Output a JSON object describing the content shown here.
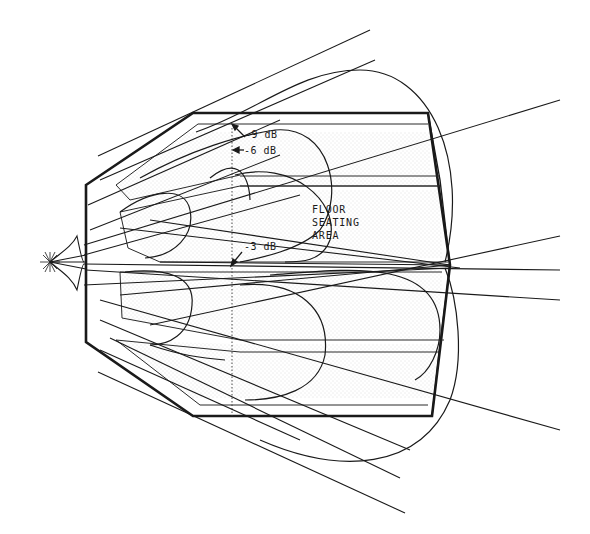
{
  "diagram": {
    "labels": {
      "db_9": "-9 dB",
      "db_6": "-6 dB",
      "db_3": "-3 dB",
      "area_line1": "FLOOR",
      "area_line2": "SEATING",
      "area_line3": "AREA"
    },
    "colors": {
      "ink": "#1a1a1a",
      "background": "#ffffff",
      "stipple": "#d8d8d8"
    },
    "elements": {
      "source": "speaker-cluster-star",
      "venue_outline": "irregular-octagon",
      "coverage_contours": [
        "-3 dB",
        "-6 dB",
        "-9 dB"
      ],
      "reference_line": "dotted-vertical"
    }
  }
}
